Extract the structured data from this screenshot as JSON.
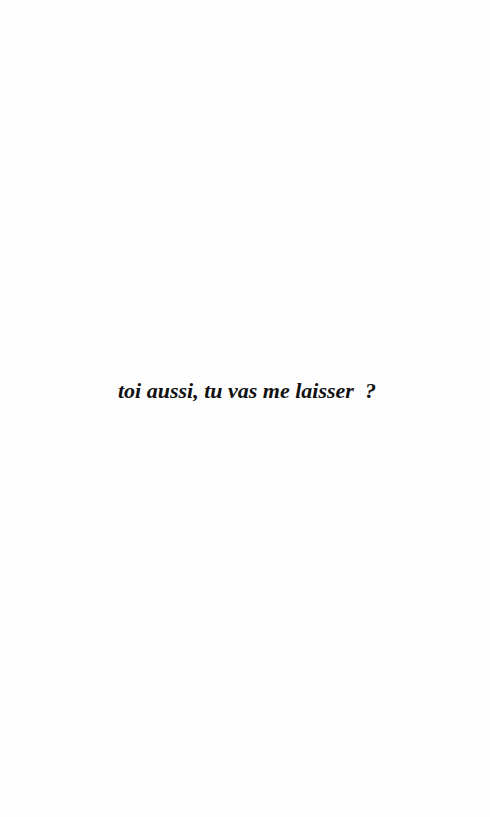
{
  "page": {
    "text": "toi aussi, tu vas me laisser  ?"
  }
}
